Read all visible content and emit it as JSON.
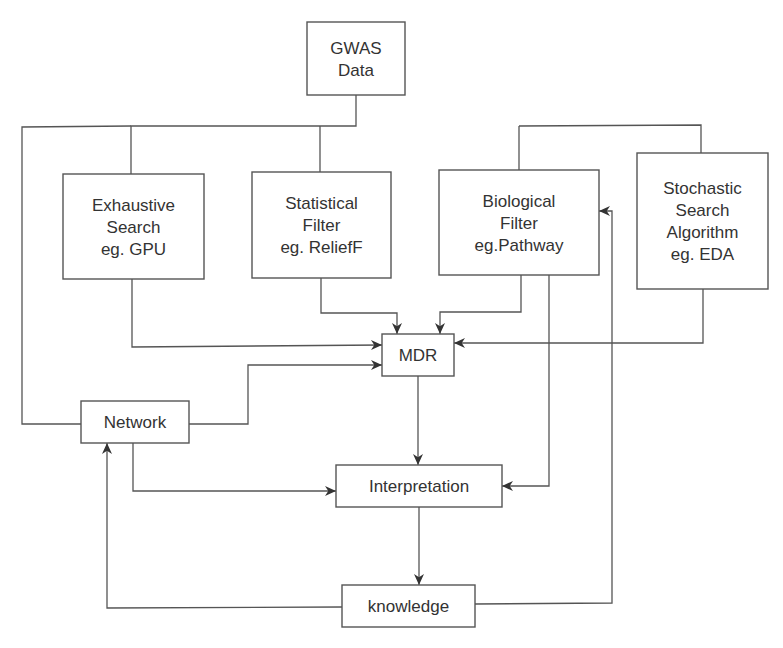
{
  "diagram": {
    "type": "flowchart",
    "nodes": [
      {
        "id": "gwas",
        "lines": [
          "GWAS",
          "Data"
        ]
      },
      {
        "id": "exhaustive",
        "lines": [
          "Exhaustive",
          "Search",
          "eg. GPU"
        ]
      },
      {
        "id": "statistical",
        "lines": [
          "Statistical",
          "Filter",
          "eg. ReliefF"
        ]
      },
      {
        "id": "biological",
        "lines": [
          "Biological",
          "Filter",
          "eg.Pathway"
        ]
      },
      {
        "id": "stochastic",
        "lines": [
          "Stochastic",
          "Search",
          "Algorithm",
          "eg. EDA"
        ]
      },
      {
        "id": "mdr",
        "lines": [
          "MDR"
        ]
      },
      {
        "id": "network",
        "lines": [
          "Network"
        ]
      },
      {
        "id": "interpretation",
        "lines": [
          "Interpretation"
        ]
      },
      {
        "id": "knowledge",
        "lines": [
          "knowledge"
        ]
      }
    ],
    "edges": [
      {
        "from": "gwas",
        "to": "exhaustive"
      },
      {
        "from": "gwas",
        "to": "statistical"
      },
      {
        "from": "gwas",
        "to": "biological"
      },
      {
        "from": "gwas",
        "to": "stochastic"
      },
      {
        "from": "gwas",
        "to": "network"
      },
      {
        "from": "exhaustive",
        "to": "mdr"
      },
      {
        "from": "statistical",
        "to": "mdr"
      },
      {
        "from": "biological",
        "to": "mdr"
      },
      {
        "from": "stochastic",
        "to": "mdr"
      },
      {
        "from": "network",
        "to": "mdr"
      },
      {
        "from": "mdr",
        "to": "interpretation"
      },
      {
        "from": "network",
        "to": "interpretation"
      },
      {
        "from": "biological",
        "to": "interpretation"
      },
      {
        "from": "interpretation",
        "to": "knowledge"
      },
      {
        "from": "knowledge",
        "to": "network"
      },
      {
        "from": "knowledge",
        "to": "biological"
      }
    ]
  }
}
